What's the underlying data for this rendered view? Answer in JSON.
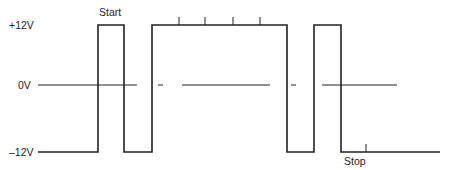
{
  "diagram": {
    "type": "waveform",
    "levels": [
      {
        "label": "+12V",
        "value": 12
      },
      {
        "label": "0V",
        "value": 0
      },
      {
        "label": "–12V",
        "value": -12
      }
    ],
    "annotations": {
      "start": "Start",
      "stop": "Stop"
    },
    "waveform_sequence": [
      "low",
      "high (start pulse)",
      "low",
      "high (long, 4 ticks)",
      "low",
      "high",
      "low (stop)"
    ],
    "tick_marks_on_long_pulse": 4,
    "colors": {
      "line": "#222222",
      "background": "#ffffff"
    }
  }
}
